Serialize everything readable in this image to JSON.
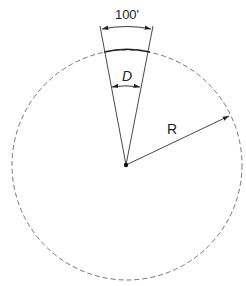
{
  "diagram": {
    "labels": {
      "arc_length": "100'",
      "central_angle": "D",
      "radius": "R"
    },
    "geometry": {
      "center": [
        126,
        165
      ],
      "radius": 115,
      "arc_left": [
        105,
        50
      ],
      "arc_right": [
        150,
        50
      ]
    },
    "colors": {
      "line": "#333333",
      "circle": "#666666",
      "background": "#ffffff"
    }
  }
}
